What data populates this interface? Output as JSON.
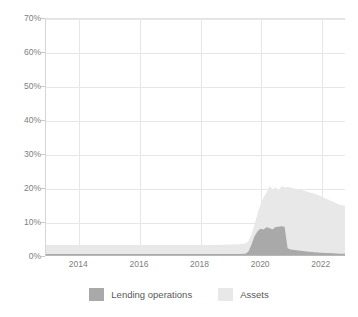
{
  "chart_data": {
    "type": "area",
    "title": "",
    "subtitle": "",
    "xlabel": "",
    "ylabel": "",
    "grid": true,
    "legend_position": "bottom",
    "stacked": false,
    "xlim": [
      2012.9,
      2022.8
    ],
    "ylim": [
      0,
      70
    ],
    "y_ticks": [
      "0%",
      "10%",
      "20%",
      "30%",
      "40%",
      "50%",
      "60%",
      "70%"
    ],
    "y_tick_values": [
      0,
      10,
      20,
      30,
      40,
      50,
      60,
      70
    ],
    "x_ticks": [
      "2014",
      "2016",
      "2018",
      "2020",
      "2022"
    ],
    "x_tick_values": [
      2014,
      2016,
      2018,
      2020,
      2022
    ],
    "series": [
      {
        "name": "Assets",
        "color": "#e8e8e8",
        "x": [
          2012.9,
          2013.5,
          2014.0,
          2014.5,
          2015.0,
          2015.5,
          2016.0,
          2016.5,
          2017.0,
          2017.5,
          2018.0,
          2018.5,
          2019.0,
          2019.3,
          2019.5,
          2019.6,
          2019.7,
          2019.8,
          2019.9,
          2020.0,
          2020.1,
          2020.2,
          2020.3,
          2020.4,
          2020.5,
          2020.6,
          2020.7,
          2020.8,
          2020.9,
          2021.0,
          2021.2,
          2021.4,
          2021.6,
          2021.8,
          2022.0,
          2022.2,
          2022.4,
          2022.6,
          2022.8
        ],
        "values": [
          3.0,
          3.0,
          3.0,
          3.0,
          3.0,
          3.0,
          3.0,
          3.0,
          3.0,
          3.0,
          3.0,
          3.0,
          3.1,
          3.2,
          3.4,
          4.0,
          6.0,
          9.0,
          12.0,
          15.0,
          17.0,
          18.5,
          20.5,
          19.5,
          20.0,
          19.0,
          20.5,
          20.0,
          20.2,
          20.0,
          19.6,
          19.2,
          18.6,
          18.2,
          17.4,
          16.6,
          15.8,
          15.0,
          14.6
        ]
      },
      {
        "name": "Lending operations",
        "color": "#a9a9a9",
        "x": [
          2012.9,
          2013.5,
          2014.0,
          2014.5,
          2015.0,
          2015.5,
          2016.0,
          2016.5,
          2017.0,
          2017.5,
          2018.0,
          2018.5,
          2019.0,
          2019.3,
          2019.5,
          2019.6,
          2019.7,
          2019.8,
          2019.9,
          2020.0,
          2020.1,
          2020.2,
          2020.3,
          2020.4,
          2020.5,
          2020.6,
          2020.7,
          2020.8,
          2020.9,
          2021.0,
          2021.2,
          2021.4,
          2021.6,
          2021.8,
          2022.0,
          2022.2,
          2022.4,
          2022.6,
          2022.8
        ],
        "values": [
          0.3,
          0.3,
          0.3,
          0.3,
          0.3,
          0.3,
          0.3,
          0.3,
          0.3,
          0.3,
          0.3,
          0.3,
          0.3,
          0.3,
          0.4,
          1.0,
          3.0,
          5.5,
          7.0,
          7.8,
          7.6,
          8.2,
          8.0,
          7.6,
          8.3,
          8.4,
          8.5,
          8.4,
          2.0,
          1.6,
          1.4,
          1.2,
          1.0,
          0.8,
          0.7,
          0.6,
          0.5,
          0.4,
          0.4
        ]
      }
    ],
    "legend": [
      {
        "label": "Lending operations",
        "color": "#a9a9a9"
      },
      {
        "label": "Assets",
        "color": "#e8e8e8"
      }
    ]
  }
}
